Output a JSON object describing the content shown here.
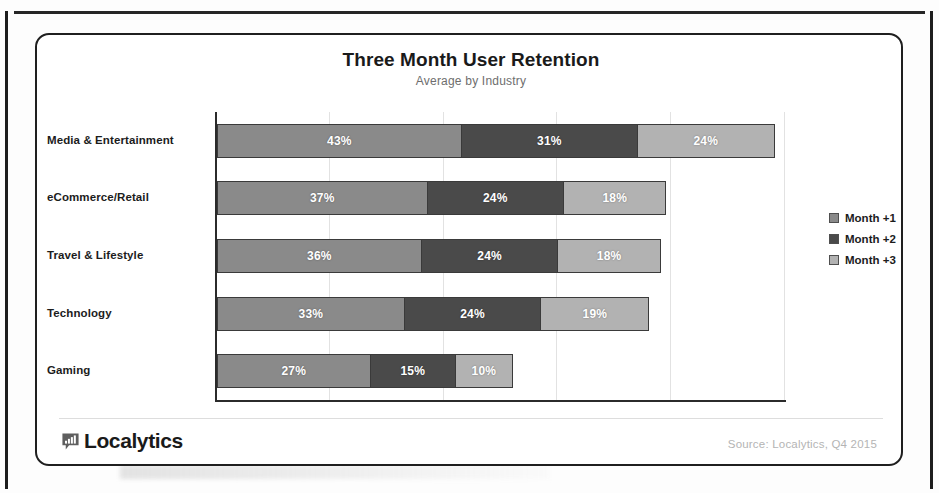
{
  "card": {
    "title": "Three Month User Retention",
    "subtitle": "Average  by Industry",
    "source_note": "Source: Localytics, Q4 2015",
    "brand_name": "Localytics",
    "brand_icon": "bar-chart-speech-bubble-icon"
  },
  "legend": {
    "position": "right",
    "items": [
      {
        "label": "Month +1",
        "color": "#8a8a8a"
      },
      {
        "label": "Month +2",
        "color": "#4a4a4a"
      },
      {
        "label": "Month +3",
        "color": "#b2b2b2"
      }
    ]
  },
  "chart_data": {
    "type": "bar",
    "orientation": "horizontal",
    "stacked": true,
    "title": "Three Month User Retention",
    "subtitle": "Average  by Industry",
    "xlabel": "",
    "ylabel": "",
    "xlim": [
      0,
      100
    ],
    "xunit": "%",
    "grid": true,
    "grid_axis": "x",
    "gridlines": [
      20,
      40,
      60,
      80,
      100
    ],
    "axis_ticks_visible": false,
    "categories": [
      "Media & Entertainment",
      "eCommerce/Retail",
      "Travel & Lifestyle",
      "Technology",
      "Gaming"
    ],
    "series": [
      {
        "name": "Month +1",
        "color": "#8a8a8a",
        "values": [
          43,
          37,
          36,
          33,
          27
        ],
        "labels": [
          "43%",
          "37%",
          "36%",
          "33%",
          "27%"
        ]
      },
      {
        "name": "Month +2",
        "color": "#4a4a4a",
        "values": [
          31,
          24,
          24,
          24,
          15
        ],
        "labels": [
          "31%",
          "24%",
          "24%",
          "24%",
          "15%"
        ]
      },
      {
        "name": "Month +3",
        "color": "#b2b2b2",
        "values": [
          24,
          18,
          18,
          19,
          10
        ],
        "labels": [
          "24%",
          "18%",
          "18%",
          "19%",
          "10%"
        ]
      }
    ],
    "totals": [
      98,
      79,
      78,
      76,
      52
    ]
  }
}
